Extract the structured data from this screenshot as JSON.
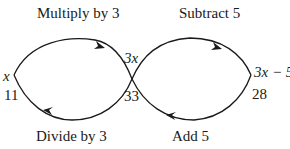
{
  "diagram": {
    "type": "function-machine-loop",
    "operations": {
      "top_left": "Multiply by 3",
      "top_right": "Subtract 5",
      "bottom_left": "Divide by 3",
      "bottom_right": "Add 5"
    },
    "nodes": {
      "left_top": "x",
      "left_bottom": "11",
      "middle_top": "3x",
      "middle_bottom": "33",
      "right_top": "3x − 5",
      "right_bottom": "28"
    },
    "colors": {
      "line": "#1a1a1a",
      "background": "#ffffff"
    }
  }
}
